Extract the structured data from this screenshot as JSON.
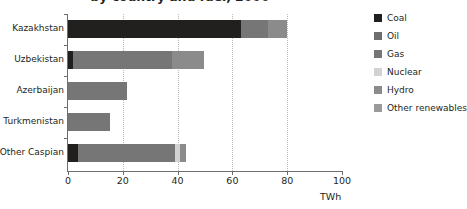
{
  "chart_data": {
    "type": "bar",
    "orientation": "horizontal",
    "stacked": true,
    "title": "by country and fuel, 2000",
    "xlabel": "TWh",
    "ylabel": "",
    "xlim": [
      0,
      100
    ],
    "xticks": [
      0,
      20,
      40,
      60,
      80,
      100
    ],
    "grid": "vertical-dotted",
    "legend_position": "right",
    "categories": [
      "Kazakhstan",
      "Uzbekistan",
      "Azerbaijan",
      "Turkmenistan",
      "Other Caspian"
    ],
    "series": [
      {
        "name": "Coal",
        "color": "#221f1f",
        "values": [
          63.0,
          2.0,
          0.0,
          0.0,
          3.8
        ]
      },
      {
        "name": "Oil",
        "color": "#6e6e6e",
        "values": [
          0.0,
          0.0,
          0.0,
          0.0,
          0.0
        ]
      },
      {
        "name": "Gas",
        "color": "#767676",
        "values": [
          10.0,
          36.0,
          21.5,
          15.5,
          35.4
        ]
      },
      {
        "name": "Nuclear",
        "color": "#d2d2d2",
        "values": [
          0.0,
          0.0,
          0.0,
          0.0,
          1.8
        ]
      },
      {
        "name": "Hydro",
        "color": "#8b8b8b",
        "values": [
          7.0,
          11.5,
          0.0,
          0.0,
          2.0
        ]
      },
      {
        "name": "Other renewables",
        "color": "#9a9a9a",
        "values": [
          0.0,
          0.0,
          0.0,
          0.0,
          0.0
        ]
      }
    ],
    "totals": [
      80.0,
      49.5,
      21.5,
      15.5,
      43.0
    ]
  },
  "legend": {
    "items": [
      {
        "label": "Coal",
        "color": "#221f1f"
      },
      {
        "label": "Oil",
        "color": "#6e6e6e"
      },
      {
        "label": "Gas",
        "color": "#767676"
      },
      {
        "label": "Nuclear",
        "color": "#d2d2d2"
      },
      {
        "label": "Hydro",
        "color": "#8b8b8b"
      },
      {
        "label": "Other renewables",
        "color": "#9a9a9a"
      }
    ]
  },
  "axis": {
    "x_tick_labels": [
      "0",
      "20",
      "40",
      "60",
      "80",
      "100"
    ],
    "x_title": "TWh"
  }
}
